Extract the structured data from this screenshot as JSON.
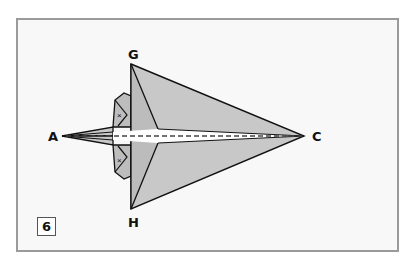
{
  "diagram": {
    "step_number": "6",
    "points": {
      "A": "A",
      "C": "C",
      "G": "G",
      "H": "H"
    },
    "colors": {
      "paper": "#c8c8c8",
      "paper_dark": "#b4b4b4",
      "line": "#111111",
      "frame": "#9a9a9a",
      "background": "#f8f8f8"
    }
  }
}
